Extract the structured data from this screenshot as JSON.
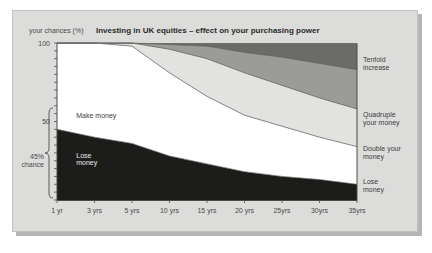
{
  "panel": {
    "background_color": "#dcdcda",
    "shadow_color": "#b5b5b3",
    "border_color": "#c2c2c0"
  },
  "chart_data": {
    "type": "area",
    "title": "Investing in UK equities – effect on your purchasing power",
    "subtitle": "",
    "xlabel": "",
    "ylabel": "your chances (%)",
    "ylim": [
      0,
      100
    ],
    "grid": false,
    "legend_position": "right",
    "stacked": true,
    "x": [
      1,
      3,
      5,
      10,
      15,
      20,
      25,
      30,
      35
    ],
    "categories": [
      "1 yr",
      "3 yrs",
      "5 yrs",
      "10 yrs",
      "15 yrs",
      "20 yrs",
      "25yrs",
      "30yrs",
      "35yrs"
    ],
    "y_ticks": [
      0,
      5,
      10,
      15,
      20,
      25,
      30,
      35,
      40,
      45,
      50,
      55,
      60,
      65,
      70,
      75,
      80,
      85,
      90,
      95,
      100
    ],
    "y_tick_labels": [
      {
        "value": 100,
        "label": "100"
      },
      {
        "value": 50,
        "label": "50"
      }
    ],
    "series": [
      {
        "name": "Lose money",
        "color": "#1c1c1a",
        "values": [
          45,
          40,
          36,
          28,
          23,
          18,
          15,
          13,
          10
        ]
      },
      {
        "name": "Make money (less than double)",
        "color": "#ffffff",
        "values": [
          55,
          60,
          62,
          53,
          43,
          36,
          32,
          27,
          24
        ]
      },
      {
        "name": "Double your money",
        "color": "#e2e2e0",
        "values": [
          0,
          0,
          2,
          15,
          24,
          27,
          26,
          25,
          24
        ]
      },
      {
        "name": "Quadruple your money",
        "color": "#9b9b99",
        "values": [
          0,
          0,
          0,
          3,
          8,
          13,
          18,
          22,
          25
        ]
      },
      {
        "name": "Tenfold increase",
        "color": "#6b6b69",
        "values": [
          0,
          0,
          0,
          1,
          2,
          6,
          9,
          13,
          17
        ]
      }
    ],
    "annotations": [
      {
        "name": "make-money-label",
        "text": "Make money",
        "x": 1.6,
        "y": 52
      },
      {
        "name": "lose-money-label-line1",
        "text": "Lose",
        "x": 1.6,
        "y": 27
      },
      {
        "name": "lose-money-label-line2",
        "text": "money",
        "x": 1.6,
        "y": 22
      },
      {
        "name": "brace-label-line1",
        "text": "45%",
        "x": -0.5,
        "y": 26
      },
      {
        "name": "brace-label-line2",
        "text": "chance",
        "x": -0.5,
        "y": 21
      }
    ],
    "right_labels": [
      {
        "name": "tenfold-increase",
        "line1": "Tenfold",
        "line2": "increase",
        "y": 88
      },
      {
        "name": "quadruple-your-money",
        "line1": "Quadruple",
        "line2": "your money",
        "y": 53
      },
      {
        "name": "double-your-money",
        "line1": "Double your",
        "line2": "money",
        "y": 31
      },
      {
        "name": "lose-money",
        "line1": "Lose",
        "line2": "money",
        "y": 10
      }
    ]
  }
}
